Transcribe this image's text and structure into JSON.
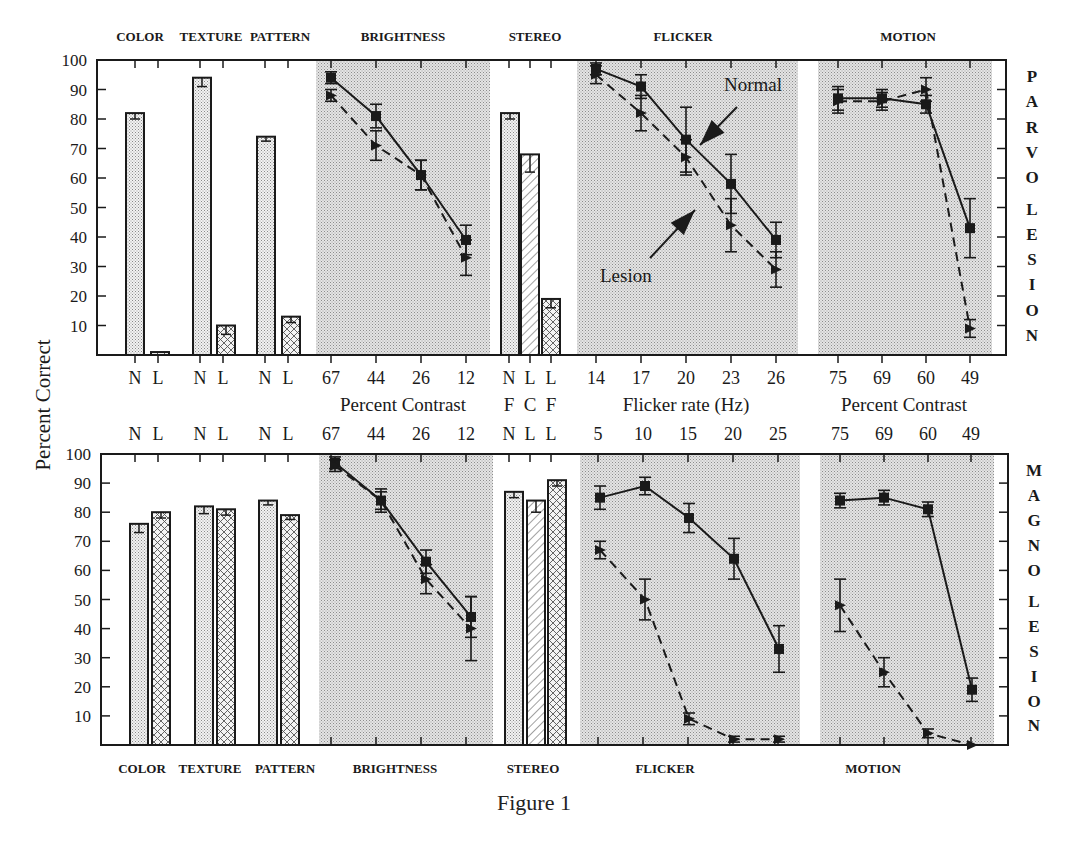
{
  "caption": "Figure 1",
  "y_axis_label": "Percent Correct",
  "y_ticks": [
    10,
    20,
    30,
    40,
    50,
    60,
    70,
    80,
    90,
    100
  ],
  "colors": {
    "ink": "#1a1a1a",
    "shade": "#d4d4d4",
    "bar_fill": "#e2e2e2",
    "background": "#ffffff"
  },
  "legend_annotations": [
    {
      "text": "Normal",
      "panel": "top",
      "x": 724,
      "y": 91,
      "arrow_from": [
        737,
        107
      ],
      "arrow_to": [
        700,
        145
      ]
    },
    {
      "text": "Lesion",
      "panel": "top",
      "x": 600,
      "y": 282,
      "arrow_from": [
        650,
        258
      ],
      "arrow_to": [
        695,
        210
      ]
    }
  ],
  "chart_data": [
    {
      "type": "bar+line",
      "panel": "top",
      "title": "PARVO LESION",
      "side_label": "PARVO LESION",
      "ylabel": "Percent Correct",
      "ylim": [
        0,
        100
      ],
      "frame": {
        "x0": 97,
        "x1": 1006,
        "y100": 60,
        "y0": 355
      },
      "group_labels": [
        {
          "text": "COLOR",
          "x": 140
        },
        {
          "text": "TEXTURE",
          "x": 211
        },
        {
          "text": "PATTERN",
          "x": 280
        },
        {
          "text": "BRIGHTNESS",
          "x": 403
        },
        {
          "text": "STEREO",
          "x": 535
        },
        {
          "text": "FLICKER",
          "x": 683
        },
        {
          "text": "MOTION",
          "x": 908
        }
      ],
      "shaded_regions": [
        [
          316,
          490
        ],
        [
          577,
          798
        ],
        [
          818,
          992
        ]
      ],
      "bars": [
        {
          "group": "COLOR",
          "label": "N",
          "x": 135,
          "value": 82,
          "err": 2,
          "fill": "dots"
        },
        {
          "group": "COLOR",
          "label": "L",
          "x": 160,
          "value": 1,
          "err": 0,
          "fill": "cross"
        },
        {
          "group": "TEXTURE",
          "label": "N",
          "x": 202,
          "value": 94,
          "err": 3,
          "fill": "dots"
        },
        {
          "group": "TEXTURE",
          "label": "L",
          "x": 226,
          "value": 10,
          "err": 3,
          "fill": "cross"
        },
        {
          "group": "PATTERN",
          "label": "N",
          "x": 266,
          "value": 74,
          "err": 1.5,
          "fill": "dots"
        },
        {
          "group": "PATTERN",
          "label": "L",
          "x": 291,
          "value": 13,
          "err": 2,
          "fill": "cross"
        },
        {
          "group": "STEREO",
          "label": "NF",
          "x": 510,
          "value": 82,
          "err": 2,
          "fill": "dots"
        },
        {
          "group": "STEREO",
          "label": "LC",
          "x": 530,
          "value": 68,
          "err": 6,
          "fill": "hatch"
        },
        {
          "group": "STEREO",
          "label": "LF",
          "x": 551,
          "value": 19,
          "err": 3,
          "fill": "cross"
        }
      ],
      "x_tick_labels": [
        {
          "text": "N",
          "x": 135
        },
        {
          "text": "L",
          "x": 158
        },
        {
          "text": "N",
          "x": 200
        },
        {
          "text": "L",
          "x": 223
        },
        {
          "text": "N",
          "x": 265
        },
        {
          "text": "L",
          "x": 288
        },
        {
          "text": "67",
          "x": 331
        },
        {
          "text": "44",
          "x": 376
        },
        {
          "text": "26",
          "x": 421
        },
        {
          "text": "12",
          "x": 466
        },
        {
          "text": "N",
          "x": 509
        },
        {
          "text": "L",
          "x": 530
        },
        {
          "text": "L",
          "x": 551
        },
        {
          "text": "14",
          "x": 596
        },
        {
          "text": "17",
          "x": 641
        },
        {
          "text": "20",
          "x": 686
        },
        {
          "text": "23",
          "x": 731
        },
        {
          "text": "26",
          "x": 776
        },
        {
          "text": "75",
          "x": 838
        },
        {
          "text": "69",
          "x": 882
        },
        {
          "text": "60",
          "x": 926
        },
        {
          "text": "49",
          "x": 970
        }
      ],
      "x_axis_titles": [
        {
          "text": "Percent Contrast",
          "x": 403
        },
        {
          "text": "F",
          "x": 509
        },
        {
          "text": "C",
          "x": 530
        },
        {
          "text": "F",
          "x": 551
        },
        {
          "text": "Flicker rate (Hz)",
          "x": 686
        },
        {
          "text": "Percent Contrast",
          "x": 904
        }
      ],
      "line_series": [
        {
          "group": "BRIGHTNESS",
          "xlabel": "Percent Contrast",
          "x": [
            67,
            44,
            26,
            12
          ],
          "px": [
            331,
            376,
            421,
            466
          ],
          "series": [
            {
              "name": "Normal",
              "style": "solid",
              "marker": "square",
              "values": [
                94,
                81,
                61,
                39
              ],
              "err": [
                2,
                4,
                5,
                5
              ]
            },
            {
              "name": "Lesion",
              "style": "dashed",
              "marker": "triangle",
              "values": [
                88,
                71,
                61,
                33
              ],
              "err": [
                2,
                5,
                5,
                6
              ]
            }
          ]
        },
        {
          "group": "FLICKER",
          "xlabel": "Flicker rate (Hz)",
          "x": [
            14,
            17,
            20,
            23,
            26
          ],
          "px": [
            596,
            641,
            686,
            731,
            776
          ],
          "series": [
            {
              "name": "Normal",
              "style": "solid",
              "marker": "square",
              "values": [
                97,
                91,
                73,
                58,
                39
              ],
              "err": [
                2,
                4,
                11,
                10,
                6
              ]
            },
            {
              "name": "Lesion",
              "style": "dashed",
              "marker": "triangle",
              "values": [
                95,
                82,
                67,
                44,
                29
              ],
              "err": [
                3,
                6,
                6,
                9,
                6
              ]
            }
          ]
        },
        {
          "group": "MOTION",
          "xlabel": "Percent Contrast",
          "x": [
            75,
            69,
            60,
            49
          ],
          "px": [
            838,
            882,
            926,
            970
          ],
          "series": [
            {
              "name": "Normal",
              "style": "solid",
              "marker": "square",
              "values": [
                87,
                87,
                85,
                43
              ],
              "err": [
                4,
                3,
                3,
                10
              ]
            },
            {
              "name": "Lesion",
              "style": "dashed",
              "marker": "triangle",
              "values": [
                86,
                86,
                90,
                9
              ],
              "err": [
                4,
                3,
                4,
                3
              ]
            }
          ]
        }
      ]
    },
    {
      "type": "bar+line",
      "panel": "bottom",
      "title": "MAGNO LESION",
      "side_label": "MAGNO LESION",
      "ylabel": "Percent Correct",
      "ylim": [
        0,
        100
      ],
      "frame": {
        "x0": 101,
        "x1": 1008,
        "y100": 454,
        "y0": 745
      },
      "group_labels": [
        {
          "text": "COLOR",
          "x": 142
        },
        {
          "text": "TEXTURE",
          "x": 210
        },
        {
          "text": "PATTERN",
          "x": 285
        },
        {
          "text": "BRIGHTNESS",
          "x": 395
        },
        {
          "text": "STEREO",
          "x": 533
        },
        {
          "text": "FLICKER",
          "x": 665
        },
        {
          "text": "MOTION",
          "x": 873
        }
      ],
      "shaded_regions": [
        [
          319,
          493
        ],
        [
          580,
          800
        ],
        [
          820,
          994
        ]
      ],
      "bars": [
        {
          "group": "COLOR",
          "label": "N",
          "x": 139,
          "value": 76,
          "err": 3,
          "fill": "dots"
        },
        {
          "group": "COLOR",
          "label": "L",
          "x": 161,
          "value": 80,
          "err": 2,
          "fill": "cross"
        },
        {
          "group": "TEXTURE",
          "label": "N",
          "x": 204,
          "value": 82,
          "err": 2.5,
          "fill": "dots"
        },
        {
          "group": "TEXTURE",
          "label": "L",
          "x": 226,
          "value": 81,
          "err": 2,
          "fill": "cross"
        },
        {
          "group": "PATTERN",
          "label": "N",
          "x": 268,
          "value": 84,
          "err": 1.5,
          "fill": "dots"
        },
        {
          "group": "PATTERN",
          "label": "L",
          "x": 290,
          "value": 79,
          "err": 1.5,
          "fill": "cross"
        },
        {
          "group": "STEREO",
          "label": "NF",
          "x": 514,
          "value": 87,
          "err": 2,
          "fill": "dots"
        },
        {
          "group": "STEREO",
          "label": "LC",
          "x": 536,
          "value": 84,
          "err": 4,
          "fill": "hatch"
        },
        {
          "group": "STEREO",
          "label": "LF",
          "x": 557,
          "value": 91,
          "err": 2,
          "fill": "cross"
        }
      ],
      "x_tick_labels": [
        {
          "text": "N",
          "x": 135
        },
        {
          "text": "L",
          "x": 158
        },
        {
          "text": "N",
          "x": 200
        },
        {
          "text": "L",
          "x": 223
        },
        {
          "text": "N",
          "x": 265
        },
        {
          "text": "L",
          "x": 288
        },
        {
          "text": "67",
          "x": 331
        },
        {
          "text": "44",
          "x": 376
        },
        {
          "text": "26",
          "x": 421
        },
        {
          "text": "12",
          "x": 466
        },
        {
          "text": "N",
          "x": 509
        },
        {
          "text": "L",
          "x": 530
        },
        {
          "text": "L",
          "x": 551
        },
        {
          "text": "5",
          "x": 598
        },
        {
          "text": "10",
          "x": 643
        },
        {
          "text": "15",
          "x": 688
        },
        {
          "text": "20",
          "x": 733
        },
        {
          "text": "25",
          "x": 778
        },
        {
          "text": "75",
          "x": 840
        },
        {
          "text": "69",
          "x": 884
        },
        {
          "text": "60",
          "x": 928
        },
        {
          "text": "49",
          "x": 971
        }
      ],
      "line_series": [
        {
          "group": "BRIGHTNESS",
          "xlabel": "Percent Contrast",
          "x": [
            67,
            44,
            26,
            12
          ],
          "px": [
            335,
            381,
            426,
            471
          ],
          "series": [
            {
              "name": "Normal",
              "style": "solid",
              "marker": "square",
              "values": [
                97,
                84,
                63,
                44
              ],
              "err": [
                2,
                4,
                4,
                7
              ]
            },
            {
              "name": "Lesion",
              "style": "dashed",
              "marker": "triangle",
              "values": [
                96,
                84,
                57,
                40
              ],
              "err": [
                2,
                3,
                5,
                11
              ]
            }
          ]
        },
        {
          "group": "FLICKER",
          "xlabel": "Flicker rate (Hz)",
          "x": [
            5,
            10,
            15,
            20,
            25
          ],
          "px": [
            600,
            645,
            689,
            734,
            779
          ],
          "series": [
            {
              "name": "Normal",
              "style": "solid",
              "marker": "square",
              "values": [
                85,
                89,
                78,
                64,
                33
              ],
              "err": [
                4,
                3,
                5,
                7,
                8
              ]
            },
            {
              "name": "Lesion",
              "style": "dashed",
              "marker": "triangle",
              "values": [
                67,
                50,
                9,
                2,
                2
              ],
              "err": [
                3,
                7,
                2,
                1,
                1
              ]
            }
          ]
        },
        {
          "group": "MOTION",
          "xlabel": "Percent Contrast",
          "x": [
            75,
            69,
            60,
            49
          ],
          "px": [
            840,
            884,
            928,
            972
          ],
          "series": [
            {
              "name": "Normal",
              "style": "solid",
              "marker": "square",
              "values": [
                84,
                85,
                81,
                19
              ],
              "err": [
                2.5,
                2.5,
                2.5,
                4
              ]
            },
            {
              "name": "Lesion",
              "style": "dashed",
              "marker": "triangle",
              "values": [
                48,
                25,
                4,
                0
              ],
              "err": [
                9,
                5,
                1.5,
                0
              ]
            }
          ]
        }
      ]
    }
  ]
}
